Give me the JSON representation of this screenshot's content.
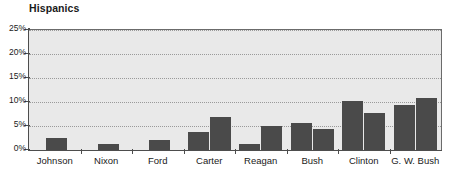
{
  "chart_data": {
    "type": "bar",
    "title": "Hispanics",
    "xlabel": "",
    "ylabel": "",
    "ylim": [
      0,
      25
    ],
    "ytick_labels": [
      "25%",
      "20%",
      "15%",
      "10%",
      "5%",
      "0%"
    ],
    "ytick_values": [
      25,
      20,
      15,
      10,
      5,
      0
    ],
    "grid": true,
    "legend": "none",
    "categories": [
      "Johnson",
      "Nixon",
      "Ford",
      "Carter",
      "Reagan",
      "Bush",
      "Clinton",
      "G. W. Bush"
    ],
    "groups": [
      {
        "label": "Johnson",
        "values": [
          2.5
        ]
      },
      {
        "label": "Nixon",
        "values": [
          1.2
        ]
      },
      {
        "label": "Ford",
        "values": [
          2.0
        ]
      },
      {
        "label": "Carter",
        "values": [
          3.8,
          6.9
        ]
      },
      {
        "label": "Reagan",
        "values": [
          1.3,
          5.1
        ]
      },
      {
        "label": "Bush",
        "values": [
          5.7,
          4.3
        ]
      },
      {
        "label": "Clinton",
        "values": [
          10.2,
          7.7
        ]
      },
      {
        "label": "G. W. Bush",
        "values": [
          9.3,
          10.8
        ]
      }
    ],
    "colors": {
      "bar": "#4a4a4a",
      "plot_background": "#e9e9e9",
      "page_background": "#ffffff",
      "axis": "#4d4d4d",
      "gridline": "#9a9a9a",
      "text": "#1a1a1a"
    }
  }
}
